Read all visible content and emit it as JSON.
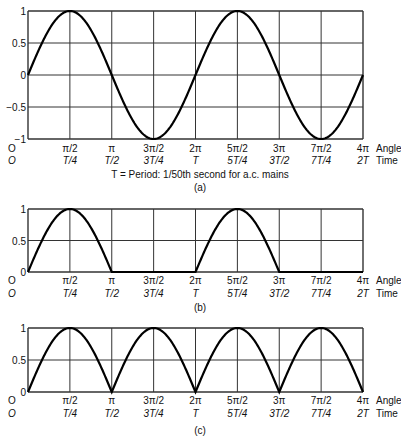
{
  "chart_data": [
    {
      "type": "line",
      "panel": "(a)",
      "title": "Full sine wave",
      "caption": "(a)",
      "note": "T = Period: 1/50th second for a.c. mains",
      "xlabel_angle": "Angle",
      "xlabel_time": "Time",
      "angle_ticks": [
        "0",
        "π/2",
        "π",
        "3π/2",
        "2π",
        "5π/2",
        "3π",
        "7π/2",
        "4π"
      ],
      "time_ticks": [
        "0",
        "T/4",
        "T/2",
        "3T/4",
        "T",
        "5T/4",
        "3T/2",
        "7T/4",
        "2T"
      ],
      "yticks": [
        "1",
        "0.5",
        "0",
        "-0.5",
        "-1"
      ],
      "ylim": [
        -1,
        1
      ],
      "x_range_rad": [
        0,
        12.566
      ],
      "function": "sin(x)",
      "x": [
        0,
        1.5708,
        3.1416,
        4.7124,
        6.2832,
        7.854,
        9.4248,
        10.9956,
        12.5664
      ],
      "values": [
        0,
        1,
        0,
        -1,
        0,
        1,
        0,
        -1,
        0
      ],
      "grid": true
    },
    {
      "type": "line",
      "panel": "(b)",
      "title": "Half-wave rectified",
      "caption": "(b)",
      "xlabel_angle": "Angle",
      "xlabel_time": "Time",
      "angle_ticks": [
        "0",
        "π/2",
        "π",
        "3π/2",
        "2π",
        "5π/2",
        "3π",
        "7π/2",
        "4π"
      ],
      "time_ticks": [
        "0",
        "T/4",
        "T/2",
        "3T/4",
        "T",
        "5T/4",
        "3T/2",
        "7T/4",
        "2T"
      ],
      "yticks": [
        "1",
        "0.5",
        "0"
      ],
      "ylim": [
        0,
        1
      ],
      "function": "max(sin(x),0)",
      "x": [
        0,
        1.5708,
        3.1416,
        4.7124,
        6.2832,
        7.854,
        9.4248,
        10.9956,
        12.5664
      ],
      "values": [
        0,
        1,
        0,
        0,
        0,
        1,
        0,
        0,
        0
      ],
      "grid": true
    },
    {
      "type": "line",
      "panel": "(c)",
      "title": "Full-wave rectified",
      "caption": "(c)",
      "xlabel_angle": "Angle",
      "xlabel_time": "Time",
      "angle_ticks": [
        "0",
        "π/2",
        "π",
        "3π/2",
        "2π",
        "5π/2",
        "3π",
        "7π/2",
        "4π"
      ],
      "time_ticks": [
        "0",
        "T/4",
        "T/2",
        "3T/4",
        "T",
        "5T/4",
        "3T/2",
        "7T/4",
        "2T"
      ],
      "yticks": [
        "1",
        "0.5",
        "0"
      ],
      "ylim": [
        0,
        1
      ],
      "function": "|sin(x)|",
      "x": [
        0,
        1.5708,
        3.1416,
        4.7124,
        6.2832,
        7.854,
        9.4248,
        10.9956,
        12.5664
      ],
      "values": [
        0,
        1,
        0,
        1,
        0,
        1,
        0,
        1,
        0
      ],
      "grid": true
    }
  ]
}
